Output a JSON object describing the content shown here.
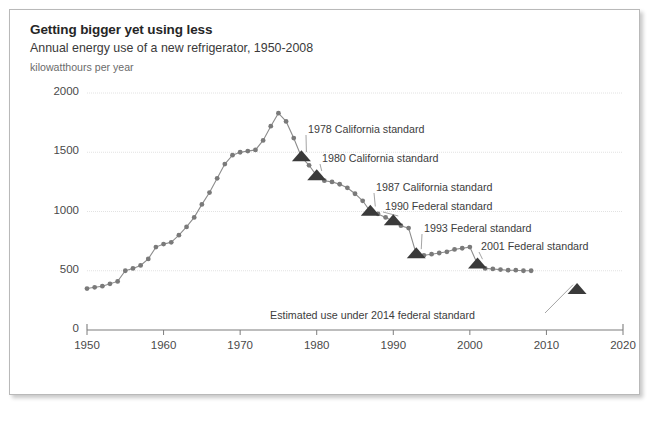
{
  "figure": {
    "title": "Getting bigger yet using less",
    "subtitle": "Annual energy use of a new refrigerator, 1950-2008",
    "units_label": "kilowatthours per year"
  },
  "chart_data": {
    "type": "line",
    "title": "Getting bigger yet using less",
    "subtitle": "Annual energy use of a new refrigerator, 1950-2008",
    "xlabel": "",
    "ylabel": "kilowatthours per year",
    "xlim": [
      1950,
      2020
    ],
    "ylim": [
      0,
      2000
    ],
    "xticks": [
      1950,
      1960,
      1970,
      1980,
      1990,
      2000,
      2010,
      2020
    ],
    "yticks": [
      0,
      500,
      1000,
      1500,
      2000
    ],
    "grid": "horizontal",
    "legend": "none",
    "series": [
      {
        "name": "Annual energy use of a new refrigerator",
        "marker": "circle",
        "color": "#8c8c8c",
        "x": [
          1950,
          1951,
          1952,
          1953,
          1954,
          1955,
          1956,
          1957,
          1958,
          1959,
          1960,
          1961,
          1962,
          1963,
          1964,
          1965,
          1966,
          1967,
          1968,
          1969,
          1970,
          1971,
          1972,
          1973,
          1974,
          1975,
          1976,
          1977,
          1978,
          1979,
          1980,
          1981,
          1982,
          1983,
          1984,
          1985,
          1986,
          1987,
          1988,
          1989,
          1990,
          1991,
          1992,
          1993,
          1994,
          1995,
          1996,
          1997,
          1998,
          1999,
          2000,
          2001,
          2002,
          2003,
          2004,
          2005,
          2006,
          2007,
          2008
        ],
        "y": [
          350,
          360,
          370,
          390,
          410,
          500,
          520,
          545,
          600,
          700,
          725,
          740,
          800,
          870,
          950,
          1060,
          1160,
          1280,
          1400,
          1475,
          1500,
          1510,
          1520,
          1600,
          1720,
          1830,
          1760,
          1620,
          1460,
          1390,
          1300,
          1260,
          1250,
          1230,
          1200,
          1150,
          1090,
          1000,
          980,
          950,
          920,
          880,
          860,
          640,
          630,
          640,
          650,
          660,
          680,
          690,
          700,
          555,
          520,
          515,
          510,
          505,
          505,
          500,
          500
        ]
      }
    ],
    "standard_markers": [
      {
        "label": "1978 California standard",
        "marker": "triangle",
        "color": "#3a3a3a",
        "x": 1978,
        "y": 1460
      },
      {
        "label": "1980 California standard",
        "marker": "triangle",
        "color": "#3a3a3a",
        "x": 1980,
        "y": 1300
      },
      {
        "label": "1987 California standard",
        "marker": "triangle",
        "color": "#3a3a3a",
        "x": 1987,
        "y": 1000
      },
      {
        "label": "1990 Federal standard",
        "marker": "triangle",
        "color": "#3a3a3a",
        "x": 1990,
        "y": 920
      },
      {
        "label": "1993 Federal standard",
        "marker": "triangle",
        "color": "#3a3a3a",
        "x": 1993,
        "y": 640
      },
      {
        "label": "2001 Federal standard",
        "marker": "triangle",
        "color": "#3a3a3a",
        "x": 2001,
        "y": 555
      },
      {
        "label": "Estimated use under 2014 federal standard",
        "marker": "triangle",
        "color": "#3a3a3a",
        "x": 2014,
        "y": 340
      }
    ],
    "annotations": [
      {
        "text": "1978 California standard",
        "tx": 308,
        "ty": 123
      },
      {
        "text": "1980 California standard",
        "tx": 322,
        "ty": 152
      },
      {
        "text": "1987 California standard",
        "tx": 376,
        "ty": 181
      },
      {
        "text": "1990 Federal standard",
        "tx": 385,
        "ty": 200
      },
      {
        "text": "1993 Federal standard",
        "tx": 424,
        "ty": 222
      },
      {
        "text": "2001 Federal standard",
        "tx": 481,
        "ty": 240
      },
      {
        "text": "Estimated use under 2014 federal standard",
        "tx": 270,
        "ty": 309
      }
    ]
  },
  "axes": {
    "y_tick_labels": [
      "2000",
      "1500",
      "1000",
      "500",
      "0"
    ],
    "x_tick_labels": [
      "1950",
      "1960",
      "1970",
      "1980",
      "1990",
      "2000",
      "2010",
      "2020"
    ]
  },
  "colors": {
    "line": "#8c8c8c",
    "marker": "#7a7a7a",
    "triangle": "#3a3a3a",
    "grid": "#e2e2e2",
    "axis": "#7d7d7d",
    "text": "#3a3a3a",
    "border": "#b9b9b9",
    "page_background": "#ffffff",
    "outer_background": "#d0d0d0"
  }
}
